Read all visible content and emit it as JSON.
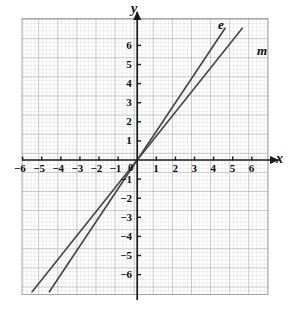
{
  "figure": {
    "kind": "coordinate-plane",
    "background": "#ffffff",
    "grid_minor_color": "#c9c9c9",
    "grid_major_color": "#9a9a9a",
    "axis_color": "#1a1a1a",
    "line_color": "#4a4a4a",
    "text_color": "#0d0d0d"
  },
  "axes": {
    "x_name": "x",
    "y_name": "y",
    "x_ticks": [
      -6,
      -5,
      -4,
      -3,
      -2,
      -1,
      1,
      2,
      3,
      4,
      5,
      6
    ],
    "y_ticks": [
      6,
      5,
      4,
      3,
      2,
      1,
      -1,
      -2,
      -3,
      -4,
      -5,
      -6
    ],
    "origin_label": "0",
    "x_tick_labels": [
      "-6",
      "-5",
      "-4",
      "-3",
      "-2",
      "-1",
      "1",
      "2",
      "3",
      "4",
      "5",
      "6"
    ],
    "y_tick_labels": [
      "6",
      "5",
      "4",
      "3",
      "2",
      "1",
      "-1",
      "-2",
      "-3",
      "-4",
      "-5",
      "-6"
    ]
  },
  "chart_data": {
    "type": "line",
    "title": "",
    "xlabel": "x",
    "ylabel": "y",
    "xlim": [
      -6.9,
      6.9
    ],
    "ylim": [
      -7.1,
      7.1
    ],
    "grid": true,
    "grid_minor_step": 0.2,
    "grid_major_step": 1,
    "legend": "inline-labels",
    "series": [
      {
        "name": "e",
        "label": "e",
        "slope": 1.5,
        "intercept": 0,
        "equation": "y = 1.5x",
        "points": [
          [
            -4.6,
            -6.9
          ],
          [
            0,
            0
          ],
          [
            4.6,
            6.9
          ]
        ],
        "label_position": [
          4.1,
          6.6
        ]
      },
      {
        "name": "m",
        "label": "m",
        "slope": 1.25,
        "intercept": 0,
        "equation": "y = 1.25x",
        "points": [
          [
            -5.5,
            -6.9
          ],
          [
            0,
            0
          ],
          [
            5.5,
            6.9
          ]
        ],
        "label_position": [
          5.5,
          5.5
        ]
      }
    ]
  }
}
